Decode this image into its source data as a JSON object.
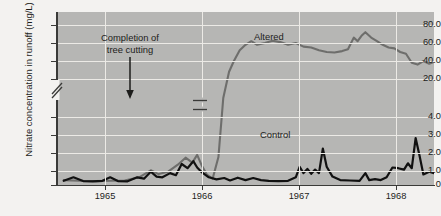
{
  "chart_data": {
    "type": "line",
    "title": "",
    "xlabel": "",
    "ylabel": "Nitrate concentration in runoff (mg/L)",
    "grid": true,
    "legend_position": "inline-annotations",
    "axis_break": {
      "between": [
        4.0,
        20.0
      ],
      "note": "broken y-axis"
    },
    "yticks": [
      "80.0",
      "60.0",
      "40.0",
      "20.0",
      "4.0",
      "3.0",
      "2.0",
      "1.0",
      "0"
    ],
    "ytick_values": [
      80.0,
      60.0,
      40.0,
      20.0,
      4.0,
      3.0,
      2.0,
      1.0,
      0
    ],
    "xticks": [
      "1965",
      "1966",
      "1967",
      "1968"
    ],
    "xlim": [
      "1964.55",
      "1968.45"
    ],
    "ylim": [
      0,
      90
    ],
    "annotations": [
      {
        "text_line1": "Completion of",
        "text_line2": "tree cutting",
        "marker": "down-arrow",
        "at_year": 1965.5
      }
    ],
    "series": [
      {
        "name": "Altered",
        "color": "#6e6e6c",
        "label": "Altered",
        "points": [
          [
            1964.62,
            0.35
          ],
          [
            1964.78,
            0.3
          ],
          [
            1964.95,
            0.28
          ],
          [
            1965.1,
            0.3
          ],
          [
            1965.25,
            0.32
          ],
          [
            1965.4,
            0.55
          ],
          [
            1965.52,
            1.05
          ],
          [
            1965.6,
            0.78
          ],
          [
            1965.7,
            0.95
          ],
          [
            1965.8,
            1.45
          ],
          [
            1965.88,
            1.95
          ],
          [
            1965.95,
            1.6
          ],
          [
            1966.0,
            2.15
          ],
          [
            1966.05,
            1.35
          ],
          [
            1966.1,
            0.75
          ],
          [
            1966.16,
            0.45
          ],
          [
            1966.22,
            2.0
          ],
          [
            1966.27,
            12.0
          ],
          [
            1966.33,
            28.0
          ],
          [
            1966.38,
            40.0
          ],
          [
            1966.44,
            52.0
          ],
          [
            1966.5,
            58.0
          ],
          [
            1966.56,
            62.0
          ],
          [
            1966.62,
            58.0
          ],
          [
            1966.7,
            60.0
          ],
          [
            1966.78,
            62.5
          ],
          [
            1966.86,
            61.0
          ],
          [
            1966.94,
            58.0
          ],
          [
            1967.02,
            60.0
          ],
          [
            1967.1,
            56.0
          ],
          [
            1967.18,
            55.0
          ],
          [
            1967.26,
            52.0
          ],
          [
            1967.34,
            50.0
          ],
          [
            1967.42,
            49.5
          ],
          [
            1967.5,
            51.0
          ],
          [
            1967.56,
            53.0
          ],
          [
            1967.62,
            66.0
          ],
          [
            1967.66,
            62.0
          ],
          [
            1967.7,
            68.0
          ],
          [
            1967.74,
            72.0
          ],
          [
            1967.8,
            66.0
          ],
          [
            1967.86,
            62.0
          ],
          [
            1967.92,
            58.0
          ],
          [
            1967.98,
            55.0
          ],
          [
            1968.04,
            54.0
          ],
          [
            1968.1,
            50.0
          ],
          [
            1968.16,
            48.0
          ],
          [
            1968.22,
            38.0
          ],
          [
            1968.28,
            36.0
          ],
          [
            1968.34,
            40.0
          ],
          [
            1968.4,
            37.0
          ],
          [
            1968.45,
            39.0
          ]
        ]
      },
      {
        "name": "Control",
        "color": "#111111",
        "label": "Control",
        "points": [
          [
            1964.62,
            0.3
          ],
          [
            1964.72,
            0.55
          ],
          [
            1964.82,
            0.28
          ],
          [
            1964.92,
            0.26
          ],
          [
            1965.02,
            0.3
          ],
          [
            1965.1,
            0.55
          ],
          [
            1965.18,
            0.28
          ],
          [
            1965.28,
            0.26
          ],
          [
            1965.38,
            0.55
          ],
          [
            1965.45,
            0.45
          ],
          [
            1965.52,
            0.95
          ],
          [
            1965.58,
            0.6
          ],
          [
            1965.64,
            0.55
          ],
          [
            1965.72,
            0.85
          ],
          [
            1965.78,
            0.7
          ],
          [
            1965.84,
            1.5
          ],
          [
            1965.9,
            1.2
          ],
          [
            1965.96,
            1.7
          ],
          [
            1966.0,
            1.25
          ],
          [
            1966.05,
            0.9
          ],
          [
            1966.12,
            0.55
          ],
          [
            1966.2,
            0.4
          ],
          [
            1966.28,
            0.5
          ],
          [
            1966.34,
            0.32
          ],
          [
            1966.42,
            0.52
          ],
          [
            1966.5,
            0.35
          ],
          [
            1966.58,
            0.5
          ],
          [
            1966.66,
            0.35
          ],
          [
            1966.74,
            0.3
          ],
          [
            1966.84,
            0.28
          ],
          [
            1966.94,
            0.3
          ],
          [
            1967.02,
            0.55
          ],
          [
            1967.06,
            1.3
          ],
          [
            1967.1,
            0.85
          ],
          [
            1967.14,
            1.15
          ],
          [
            1967.18,
            0.8
          ],
          [
            1967.22,
            1.1
          ],
          [
            1967.26,
            0.85
          ],
          [
            1967.3,
            2.6
          ],
          [
            1967.34,
            1.3
          ],
          [
            1967.4,
            0.6
          ],
          [
            1967.48,
            0.35
          ],
          [
            1967.58,
            0.32
          ],
          [
            1967.68,
            0.3
          ],
          [
            1967.74,
            0.85
          ],
          [
            1967.78,
            0.35
          ],
          [
            1967.84,
            0.42
          ],
          [
            1967.9,
            0.35
          ],
          [
            1967.96,
            0.55
          ],
          [
            1968.02,
            1.25
          ],
          [
            1968.08,
            1.2
          ],
          [
            1968.14,
            1.1
          ],
          [
            1968.18,
            1.55
          ],
          [
            1968.22,
            1.2
          ],
          [
            1968.26,
            3.35
          ],
          [
            1968.3,
            2.1
          ],
          [
            1968.34,
            0.75
          ],
          [
            1968.4,
            0.95
          ],
          [
            1968.45,
            0.85
          ]
        ]
      }
    ]
  },
  "axis": {
    "y_title": "Nitrate concentration in runoff (mg/L)",
    "y_labels": [
      "80.0",
      "60.0",
      "40.0",
      "20.0",
      "4.0",
      "3.0",
      "2.0",
      "1.0",
      "0"
    ],
    "x_labels": [
      "1965",
      "1966",
      "1967",
      "1968"
    ]
  },
  "labels": {
    "altered": "Altered",
    "control": "Control",
    "annotation_line1": "Completion of",
    "annotation_line2": "tree cutting"
  },
  "colors": {
    "panel": "#b6b6b4",
    "grid": "#eceae6",
    "altered": "#6e6e6c",
    "control": "#111111",
    "axis": "#3a3a38",
    "page": "#f3f2f0"
  }
}
